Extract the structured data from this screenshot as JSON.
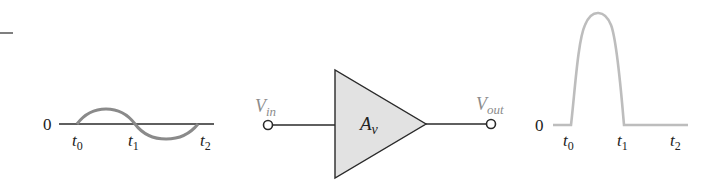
{
  "diagram": {
    "colors": {
      "line": "#2a2a2a",
      "waveform": "#8a8a8a",
      "output_waveform": "#bdbdbd",
      "amplifier_fill": "#e2e2e2",
      "port_label": "#8c8c8c"
    },
    "input_plot": {
      "zero_label": "0",
      "ticks": [
        {
          "main": "t",
          "sub": "0"
        },
        {
          "main": "t",
          "sub": "1"
        },
        {
          "main": "t",
          "sub": "2"
        }
      ],
      "waveform": "sine (one full cycle t0 to t2)"
    },
    "amplifier": {
      "gain_main": "A",
      "gain_sub": "v",
      "input_label_main": "V",
      "input_label_sub": "in",
      "output_label_main": "V",
      "output_label_sub": "out"
    },
    "output_plot": {
      "zero_label": "0",
      "ticks": [
        {
          "main": "t",
          "sub": "0"
        },
        {
          "main": "t",
          "sub": "1"
        },
        {
          "main": "t",
          "sub": "2"
        }
      ],
      "waveform": "half-wave positive pulse between t0 and t1, zero from t1 to t2"
    }
  }
}
